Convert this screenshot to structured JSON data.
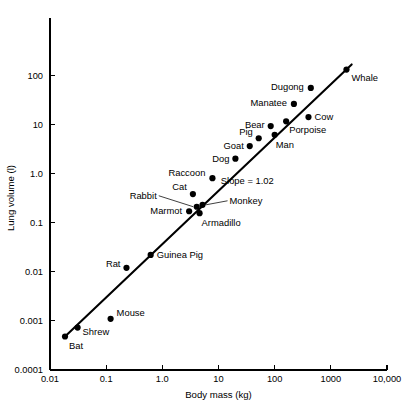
{
  "chart_data": {
    "type": "scatter",
    "title": "",
    "xlabel": "Body mass (kg)",
    "ylabel": "Lung volume (l)",
    "xscale": "log",
    "yscale": "log",
    "xlim": [
      0.01,
      10000
    ],
    "ylim": [
      0.0001,
      1000
    ],
    "grid": false,
    "legend": null,
    "xticks": [
      "0.01",
      "0.1",
      "1.0",
      "10",
      "100",
      "1000",
      "10,000"
    ],
    "xtick_values": [
      0.01,
      0.1,
      1,
      10,
      100,
      1000,
      10000
    ],
    "yticks": [
      "0.0001",
      "0.001",
      "0.01",
      "0.1",
      "1.0",
      "10",
      "100"
    ],
    "ytick_values": [
      0.0001,
      0.001,
      0.01,
      0.1,
      1,
      10,
      100
    ],
    "annotations": [
      {
        "text": "Slope = 1.02",
        "x": 11,
        "y": 0.62
      }
    ],
    "fit_line": {
      "slope": 1.02,
      "label": "Slope = 1.02",
      "x_start": 0.0185,
      "y_start": 0.00048,
      "x_end": 2350,
      "y_end": 165
    },
    "points": [
      {
        "name": "Bat",
        "x": 0.0185,
        "y": 0.00048,
        "label": "Bat",
        "label_dx": 4,
        "label_dy": 12,
        "anchor": "start"
      },
      {
        "name": "Shrew",
        "x": 0.031,
        "y": 0.00073,
        "label": "Shrew",
        "label_dx": 5,
        "label_dy": 7,
        "anchor": "start"
      },
      {
        "name": "Mouse",
        "x": 0.12,
        "y": 0.0011,
        "label": "Mouse",
        "label_dx": 6,
        "label_dy": -3,
        "anchor": "start"
      },
      {
        "name": "Rat",
        "x": 0.23,
        "y": 0.012,
        "label": "Rat",
        "label_dx": -6,
        "label_dy": -1,
        "anchor": "end"
      },
      {
        "name": "Guinea Pig",
        "x": 0.62,
        "y": 0.022,
        "label": "Guinea Pig",
        "label_dx": 6,
        "label_dy": 3,
        "anchor": "start"
      },
      {
        "name": "Marmot",
        "x": 3.0,
        "y": 0.17,
        "label": "Marmot",
        "label_dx": -7,
        "label_dy": 3,
        "anchor": "end"
      },
      {
        "name": "Rabbit",
        "x": 4.1,
        "y": 0.21,
        "label": "Rabbit",
        "label_dx": -40,
        "label_dy": -8,
        "anchor": "end",
        "leader": true
      },
      {
        "name": "Armadillo",
        "x": 4.6,
        "y": 0.155,
        "label": "Armadillo",
        "label_dx": 2,
        "label_dy": 13,
        "anchor": "start"
      },
      {
        "name": "Monkey",
        "x": 5.2,
        "y": 0.23,
        "label": "Monkey",
        "label_dx": 27,
        "label_dy": -1,
        "anchor": "start",
        "leader": true
      },
      {
        "name": "Cat",
        "x": 3.5,
        "y": 0.38,
        "label": "Cat",
        "label_dx": -6,
        "label_dy": -4,
        "anchor": "end"
      },
      {
        "name": "Raccoon",
        "x": 7.8,
        "y": 0.8,
        "label": "Raccoon",
        "label_dx": -7,
        "label_dy": -2,
        "anchor": "end"
      },
      {
        "name": "Dog",
        "x": 20,
        "y": 2.0,
        "label": "Dog",
        "label_dx": -6,
        "label_dy": 3,
        "anchor": "end"
      },
      {
        "name": "Goat",
        "x": 36,
        "y": 3.6,
        "label": "Goat",
        "label_dx": -6,
        "label_dy": 3,
        "anchor": "end"
      },
      {
        "name": "Pig",
        "x": 52,
        "y": 5.2,
        "label": "Pig",
        "label_dx": -6,
        "label_dy": -3,
        "anchor": "end"
      },
      {
        "name": "Bear",
        "x": 85,
        "y": 9.2,
        "label": "Bear",
        "label_dx": -6,
        "label_dy": 2,
        "anchor": "end"
      },
      {
        "name": "Man",
        "x": 100,
        "y": 6.1,
        "label": "Man",
        "label_dx": 1,
        "label_dy": 13,
        "anchor": "start"
      },
      {
        "name": "Porpoise",
        "x": 160,
        "y": 11.5,
        "label": "Porpoise",
        "label_dx": 3,
        "label_dy": 12,
        "anchor": "start"
      },
      {
        "name": "Cow",
        "x": 400,
        "y": 14,
        "label": "Cow",
        "label_dx": 6,
        "label_dy": 3,
        "anchor": "start"
      },
      {
        "name": "Manatee",
        "x": 220,
        "y": 26,
        "label": "Manatee",
        "label_dx": -7,
        "label_dy": 2,
        "anchor": "end"
      },
      {
        "name": "Dugong",
        "x": 440,
        "y": 55,
        "label": "Dugong",
        "label_dx": -7,
        "label_dy": 2,
        "anchor": "end"
      },
      {
        "name": "Whale",
        "x": 1900,
        "y": 130,
        "label": "Whale",
        "label_dx": 5,
        "label_dy": 11,
        "anchor": "start"
      }
    ]
  },
  "plot_geometry": {
    "left": 50,
    "right": 387,
    "top": 26,
    "bottom": 370,
    "point_radius": 3.1
  }
}
